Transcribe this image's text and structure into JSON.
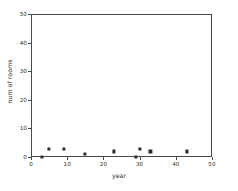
{
  "chart_data": {
    "type": "scatter",
    "title": "",
    "xlabel": "year",
    "ylabel": "num of rooms",
    "xlim": [
      0,
      50
    ],
    "ylim": [
      0,
      50
    ],
    "xticks": [
      0,
      10,
      20,
      30,
      40,
      50
    ],
    "yticks": [
      0,
      10,
      20,
      30,
      40,
      50
    ],
    "grid": false,
    "legend": null,
    "marker": "filled-square",
    "marker_color": "#2b2b2b",
    "background_color": "#ffffff",
    "axis_color": "#4a4a4a",
    "series": [
      {
        "name": "rooms",
        "points": [
          {
            "x": 3,
            "y": 1
          },
          {
            "x": 5,
            "y": 4
          },
          {
            "x": 9,
            "y": 4
          },
          {
            "x": 15,
            "y": 2
          },
          {
            "x": 23,
            "y": 3
          },
          {
            "x": 29,
            "y": 1
          },
          {
            "x": 30,
            "y": 4
          },
          {
            "x": 33,
            "y": 3
          },
          {
            "x": 43,
            "y": 3
          }
        ]
      }
    ]
  }
}
